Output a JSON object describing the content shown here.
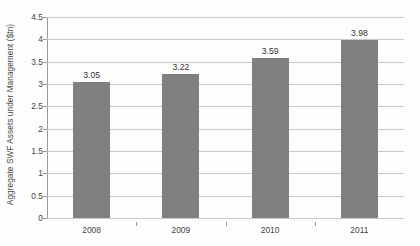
{
  "chart_data": {
    "type": "bar",
    "title": "",
    "subtitle": "",
    "xlabel": "",
    "ylabel": "Aggregate SWF Assets under Management ($tn)",
    "categories": [
      "2008",
      "2009",
      "2010",
      "2011"
    ],
    "values": [
      3.05,
      3.22,
      3.59,
      3.98
    ],
    "value_labels": [
      "3.05",
      "3.22",
      "3.59",
      "3.98"
    ],
    "ylim": [
      0,
      4.5
    ],
    "ytick_labels": [
      "0",
      "0.5",
      "1",
      "1.5",
      "2",
      "2.5",
      "3",
      "3.5",
      "4",
      "4.5"
    ],
    "ytick_values": [
      0,
      0.5,
      1,
      1.5,
      2,
      2.5,
      3,
      3.5,
      4,
      4.5
    ],
    "grid": "horizontal",
    "legend": "none",
    "series": [
      {
        "name": "Aggregate SWF Assets under Management ($tn)",
        "values": [
          3.05,
          3.22,
          3.59,
          3.98
        ],
        "color": "#808080"
      }
    ],
    "colors": {
      "bar": "#808080",
      "gridline": "#c9c9c9",
      "axis": "#9a9a9a",
      "background": "#fdfdfd",
      "tick_text": "#444444",
      "value_text": "#333333"
    }
  }
}
